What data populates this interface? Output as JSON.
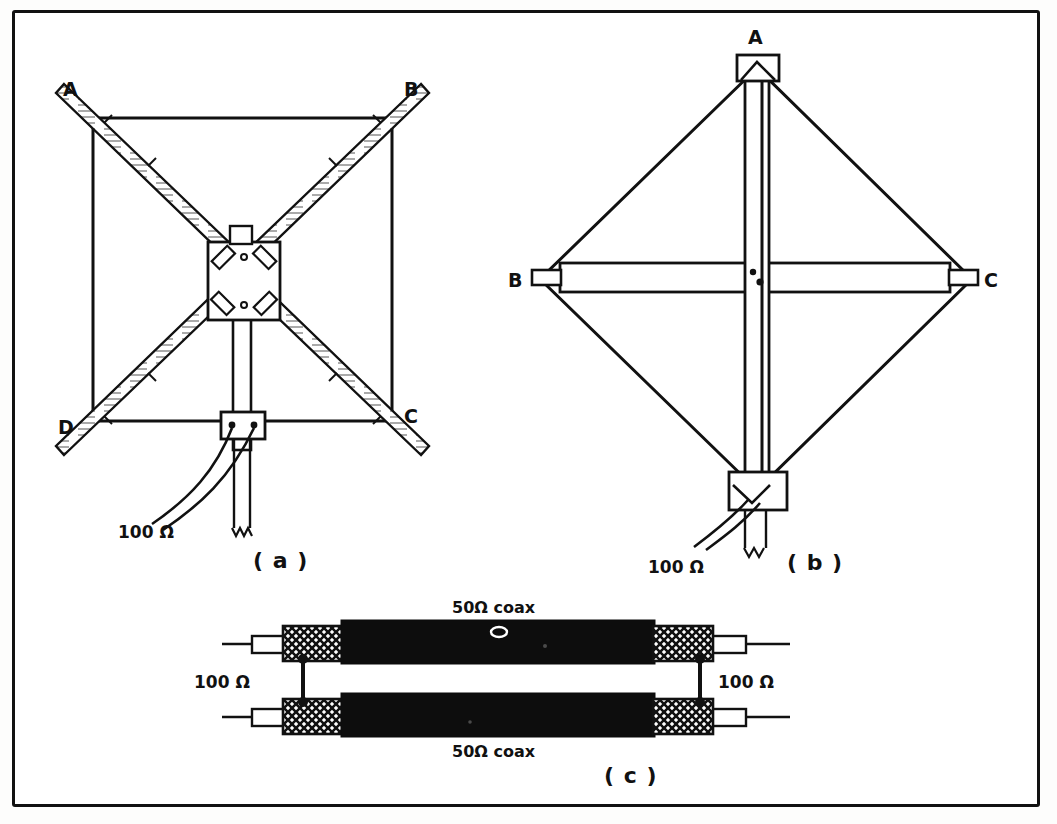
{
  "figure": {
    "title_visible": false,
    "background_color": "#ffffff",
    "ink_color": "#111111",
    "frame": {
      "visible": true,
      "style": "rectangular-border"
    }
  },
  "panels": [
    {
      "id": "a",
      "caption": "( a )",
      "description": "front view of quad loop on X spreaders",
      "node_labels": [
        "A",
        "B",
        "C",
        "D"
      ],
      "feed_label": "100 Ω",
      "hub": {
        "type": "square-plate",
        "clamps": 4
      },
      "feed_box": {
        "terminals": 2
      }
    },
    {
      "id": "b",
      "caption": "( b )",
      "description": "diamond view of quad loop with boom and mast",
      "node_labels": [
        "A",
        "B",
        "C"
      ],
      "feed_label": "100 Ω",
      "center_dots": 2
    },
    {
      "id": "c",
      "caption": "( c )",
      "description": "half-wave coaxial balun made from two 50 ohm coax sections",
      "coax_top_label": "50Ω coax",
      "coax_bottom_label": "50Ω coax",
      "left_impedance_label": "100 Ω",
      "right_impedance_label": "100 Ω",
      "coax_count": 2,
      "braid_blocks": 4
    }
  ],
  "labels": {
    "a_node_A": "A",
    "a_node_B": "B",
    "a_node_C": "C",
    "a_node_D": "D",
    "a_ohm": "100 Ω",
    "a_caption": "( a )",
    "b_node_A": "A",
    "b_node_B": "B",
    "b_node_C": "C",
    "b_ohm": "100 Ω",
    "b_caption": "( b )",
    "c_coax_top": "50Ω coax",
    "c_coax_bottom": "50Ω coax",
    "c_ohm_left": "100 Ω",
    "c_ohm_right": "100 Ω",
    "c_caption": "( c )"
  },
  "colors": {
    "ink": "#111111",
    "paper": "#ffffff",
    "coax_jacket": "#0d0d0d",
    "braid_fill": "#ffffff"
  }
}
